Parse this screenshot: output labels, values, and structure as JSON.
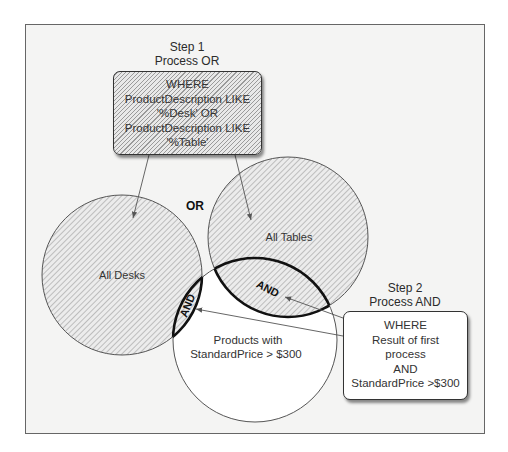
{
  "diagram": {
    "step1": {
      "title": "Step 1",
      "subtitle": "Process OR",
      "lines": [
        "WHERE",
        "ProductDescription LIKE",
        "'%Desk' OR",
        "ProductDescription LIKE",
        "'%Table'"
      ]
    },
    "step2": {
      "title": "Step 2",
      "subtitle": "Process AND",
      "lines": [
        "WHERE",
        "Result of first",
        "process",
        "AND",
        "StandardPrice >$300"
      ]
    },
    "operator_or": "OR",
    "sets": {
      "desks": "All Desks",
      "tables": "All Tables",
      "price_line1": "Products with",
      "price_line2": "StandardPrice > $300"
    },
    "intersection_left": "AND",
    "intersection_right": "AND",
    "colors": {
      "background": "#f4f4f3",
      "frame_border": "#666666",
      "hatch": "#9a9a9a",
      "intersection_border": "#111111"
    }
  }
}
